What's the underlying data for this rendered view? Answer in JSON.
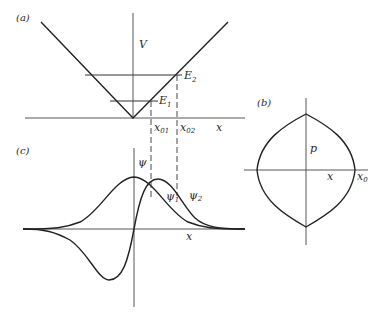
{
  "figure": {
    "panel_a": {
      "label": "(a)",
      "axis_label_y": "V",
      "axis_label_x": "x",
      "energy_levels": [
        {
          "name": "E",
          "sub": "1"
        },
        {
          "name": "E",
          "sub": "2"
        }
      ],
      "turning_points": [
        {
          "name": "x",
          "sub": "01"
        },
        {
          "name": "x",
          "sub": "02"
        }
      ]
    },
    "panel_b": {
      "label": "(b)",
      "axis_label_y": "p",
      "axis_label_x": "x",
      "extent_label": {
        "name": "x",
        "sub": "0"
      }
    },
    "panel_c": {
      "label": "(c)",
      "axis_label_y": "ψ",
      "axis_label_x": "x",
      "curves": [
        {
          "name": "ψ",
          "sub": "1"
        },
        {
          "name": "ψ",
          "sub": "2"
        }
      ]
    }
  },
  "colors": {
    "ink": "#222222",
    "background": "#ffffff"
  }
}
